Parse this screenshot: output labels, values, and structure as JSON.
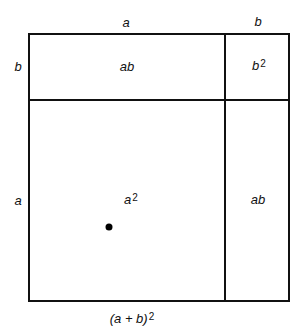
{
  "diagram": {
    "caption": {
      "base": "(a + b)",
      "exp": "2"
    },
    "side_labels": {
      "top_a": "a",
      "top_b": "b",
      "left_b": "b",
      "left_a": "a"
    },
    "regions": {
      "top_left": {
        "text": "ab"
      },
      "top_right": {
        "base": "b",
        "exp": "2"
      },
      "bottom_left": {
        "base": "a",
        "exp": "2"
      },
      "bottom_right": {
        "text": "ab"
      }
    },
    "colors": {
      "stroke": "#111111",
      "background": "#ffffff"
    }
  }
}
